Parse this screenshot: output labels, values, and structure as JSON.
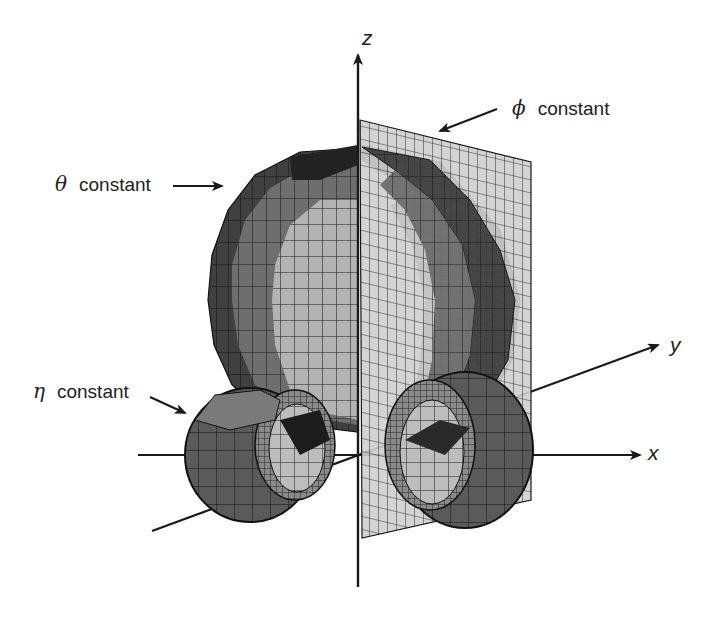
{
  "figure": {
    "type": "toroidal-coordinates-illustration",
    "axes": {
      "x": {
        "label": "x"
      },
      "y": {
        "label": "y"
      },
      "z": {
        "label": "z"
      }
    },
    "annotations": [
      {
        "id": "theta",
        "symbol": "θ",
        "text": "constant",
        "surface": "sphere-like bowl (cutaway)"
      },
      {
        "id": "phi",
        "symbol": "ϕ",
        "text": "constant",
        "surface": "half-plane"
      },
      {
        "id": "eta",
        "symbol": "η",
        "text": "constant",
        "surface": "torus"
      }
    ],
    "colors": {
      "background": "#ffffff",
      "ink": "#1a1a1a",
      "surface_dark": "#2b2b2b",
      "surface_mid": "#6e6e6e",
      "surface_light": "#a9a9a9",
      "plane_fill": "#cfcfcf"
    }
  }
}
